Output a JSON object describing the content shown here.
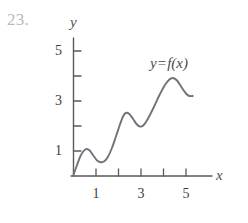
{
  "problem": {
    "number": "23."
  },
  "axes": {
    "x_label": "x",
    "y_label": "y",
    "x_ticks": [
      {
        "label": "1",
        "value": 1
      },
      {
        "label": "",
        "value": 2
      },
      {
        "label": "3",
        "value": 3
      },
      {
        "label": "",
        "value": 4
      },
      {
        "label": "5",
        "value": 5
      }
    ],
    "y_ticks": [
      {
        "label": "1",
        "value": 1
      },
      {
        "label": "",
        "value": 2
      },
      {
        "label": "3",
        "value": 3
      },
      {
        "label": "",
        "value": 4
      },
      {
        "label": "5",
        "value": 5
      }
    ],
    "x_tick_labels": [
      "1",
      "3",
      "5"
    ],
    "y_tick_labels": [
      "5",
      "3",
      "1"
    ]
  },
  "curve": {
    "equation_y": "y",
    "equation_op": "=",
    "equation_f": "f(x)",
    "equation_full": "y = f(x)",
    "color": "#6f737a"
  },
  "colors": {
    "curve": "#6f737a",
    "axis": "#5a5a5a",
    "text": "#3c3c3c",
    "problem_number": "#b9b9b9",
    "background": "#ffffff"
  },
  "chart_data": {
    "type": "line",
    "title": "",
    "subtitle": "",
    "xlabel": "x",
    "ylabel": "y",
    "xlim": [
      0,
      5.6
    ],
    "ylim": [
      0,
      5.4
    ],
    "grid": false,
    "legend": "none",
    "annotations": [
      {
        "text": "y = f(x)",
        "x": 3.9,
        "y": 4.7
      },
      {
        "text": "23.",
        "x": -2.9,
        "y": 5.2
      }
    ],
    "xticks": [
      1,
      2,
      3,
      4,
      5
    ],
    "xticklabels": [
      "1",
      "",
      "3",
      "",
      "5"
    ],
    "yticks": [
      1,
      2,
      3,
      4,
      5
    ],
    "yticklabels": [
      "1",
      "",
      "3",
      "",
      "5"
    ],
    "series": [
      {
        "name": "f(x)",
        "color": "#6f737a",
        "x": [
          0.0,
          0.15,
          0.3,
          0.45,
          0.58,
          0.72,
          0.88,
          1.05,
          1.2,
          1.35,
          1.5,
          1.7,
          1.9,
          2.05,
          2.2,
          2.32,
          2.48,
          2.65,
          2.8,
          2.95,
          3.1,
          3.3,
          3.55,
          3.8,
          4.05,
          4.25,
          4.42,
          4.6,
          4.8,
          5.0,
          5.15,
          5.3
        ],
        "y": [
          0.05,
          0.42,
          0.78,
          1.0,
          1.08,
          1.02,
          0.82,
          0.62,
          0.55,
          0.58,
          0.72,
          1.1,
          1.62,
          2.02,
          2.38,
          2.52,
          2.48,
          2.28,
          2.08,
          1.98,
          2.02,
          2.28,
          2.72,
          3.2,
          3.62,
          3.85,
          3.92,
          3.82,
          3.55,
          3.3,
          3.2,
          3.2
        ]
      }
    ]
  }
}
